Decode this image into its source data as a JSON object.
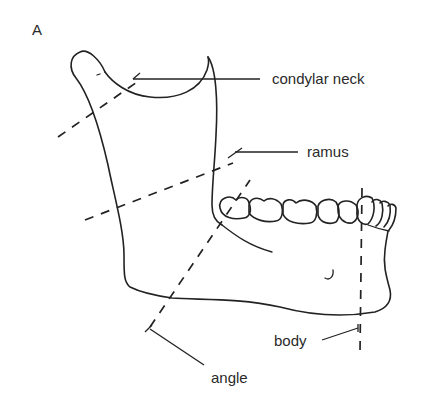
{
  "figure": {
    "panel_label": "A"
  },
  "labels": {
    "condylar_neck": "condylar neck",
    "ramus": "ramus",
    "body": "body",
    "angle": "angle"
  },
  "colors": {
    "stroke": "#222222",
    "text": "#2a2a2a",
    "background": "#ffffff"
  }
}
